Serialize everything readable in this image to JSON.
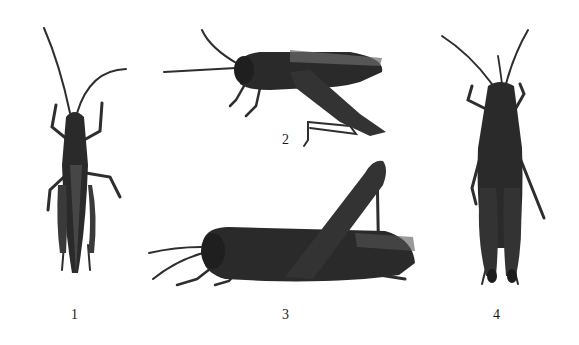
{
  "plate": {
    "background": "#ffffff",
    "specimen_color": "#2a2a2a",
    "figures": [
      {
        "id": "1",
        "label": "1",
        "view": "dorsal"
      },
      {
        "id": "2",
        "label": "2",
        "view": "lateral"
      },
      {
        "id": "3",
        "label": "3",
        "view": "lateral"
      },
      {
        "id": "4",
        "label": "4",
        "view": "dorsal"
      }
    ]
  }
}
